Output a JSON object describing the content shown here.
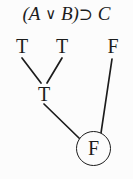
{
  "diagram": {
    "kind": "truth-value-assignment-tree",
    "formula": {
      "full_text": "(A ∨ B) ⊃ C",
      "open_paren": "(",
      "left_operand": "A",
      "disjunction_symbol": "∨",
      "right_operand": "B",
      "close_paren": ")",
      "conditional_symbol": "⊃",
      "consequent": "C"
    },
    "values": {
      "a": "T",
      "b": "T",
      "c": "F",
      "disjunction": "T",
      "conditional": "F"
    },
    "circled_value": "F",
    "colors": {
      "ink": "#1c1c1c",
      "background": "#fcfcfc"
    },
    "edges": [
      {
        "from": "a",
        "to": "disjunction"
      },
      {
        "from": "b",
        "to": "disjunction"
      },
      {
        "from": "disjunction",
        "to": "conditional"
      },
      {
        "from": "c",
        "to": "conditional"
      }
    ]
  }
}
